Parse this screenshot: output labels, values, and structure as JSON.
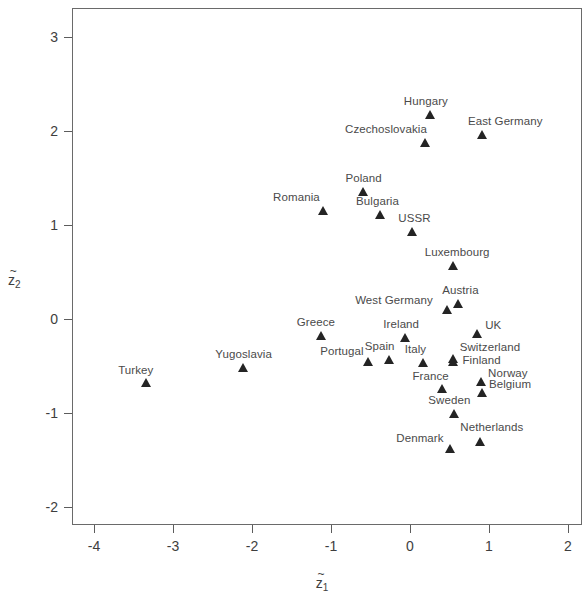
{
  "chart_data": {
    "type": "scatter",
    "title": "",
    "xlabel": "z̃₁",
    "ylabel": "z̃₂",
    "xlim": [
      -4.6,
      2.1
    ],
    "ylim": [
      -2.2,
      3.3
    ],
    "xticks": [
      -4,
      -3,
      -2,
      -1,
      0,
      1,
      2
    ],
    "xticklabels": [
      "-4",
      "-3",
      "-2",
      "-1",
      "0",
      "1",
      "2"
    ],
    "yticks": [
      -2,
      -1,
      0,
      1,
      2,
      3
    ],
    "yticklabels": [
      "-2",
      "-1",
      "0",
      "1",
      "2",
      "3"
    ],
    "grid": false,
    "legend": null,
    "marker": "triangle-up",
    "marker_color": "#242424",
    "points": [
      {
        "label": "Hungary",
        "x": 0.25,
        "y": 2.13,
        "lx": -26,
        "ly": -14
      },
      {
        "label": "East Germany",
        "x": 0.91,
        "y": 1.92,
        "lx": -14,
        "ly": -14
      },
      {
        "label": "Czechoslovakia",
        "x": 0.19,
        "y": 1.83,
        "lx": -80,
        "ly": -14
      },
      {
        "label": "Poland",
        "x": -0.59,
        "y": 1.31,
        "lx": -18,
        "ly": -14
      },
      {
        "label": "Romania",
        "x": -1.1,
        "y": 1.11,
        "lx": -50,
        "ly": -14
      },
      {
        "label": "Bulgaria",
        "x": -0.38,
        "y": 1.06,
        "lx": -24,
        "ly": -14
      },
      {
        "label": "USSR",
        "x": 0.03,
        "y": 0.88,
        "lx": -14,
        "ly": -14
      },
      {
        "label": "Luxembourg",
        "x": 0.54,
        "y": 0.52,
        "lx": -28,
        "ly": -14
      },
      {
        "label": "Austria",
        "x": 0.61,
        "y": 0.12,
        "lx": -16,
        "ly": -14
      },
      {
        "label": "West Germany",
        "x": 0.47,
        "y": 0.05,
        "lx": -92,
        "ly": -10
      },
      {
        "label": "Greece",
        "x": -1.13,
        "y": -0.22,
        "lx": -24,
        "ly": -14
      },
      {
        "label": "UK",
        "x": 0.85,
        "y": -0.2,
        "lx": 8,
        "ly": -9
      },
      {
        "label": "Ireland",
        "x": -0.06,
        "y": -0.24,
        "lx": -22,
        "ly": -14
      },
      {
        "label": "Switzerland",
        "x": 0.54,
        "y": -0.47,
        "lx": 7,
        "ly": -12
      },
      {
        "label": "Spain",
        "x": -0.27,
        "y": -0.48,
        "lx": -24,
        "ly": -14
      },
      {
        "label": "Italy",
        "x": 0.16,
        "y": -0.51,
        "lx": -18,
        "ly": -14
      },
      {
        "label": "Portugal",
        "x": -0.53,
        "y": -0.5,
        "lx": -48,
        "ly": -11
      },
      {
        "label": "Yugoslavia",
        "x": -2.11,
        "y": -0.56,
        "lx": -28,
        "ly": -14
      },
      {
        "label": "Finland",
        "x": 0.55,
        "y": -0.5,
        "lx": 9,
        "ly": -2
      },
      {
        "label": "France",
        "x": 0.41,
        "y": -0.79,
        "lx": -30,
        "ly": -13
      },
      {
        "label": "Norway",
        "x": 0.9,
        "y": -0.71,
        "lx": 7,
        "ly": -9
      },
      {
        "label": "Belgium",
        "x": 0.91,
        "y": -0.83,
        "lx": 7,
        "ly": -9
      },
      {
        "label": "Turkey",
        "x": -3.34,
        "y": -0.72,
        "lx": -28,
        "ly": -13
      },
      {
        "label": "Sweden",
        "x": 0.56,
        "y": -1.05,
        "lx": -26,
        "ly": -14
      },
      {
        "label": "Netherlands",
        "x": 0.89,
        "y": -1.35,
        "lx": -20,
        "ly": -15
      },
      {
        "label": "Denmark",
        "x": 0.51,
        "y": -1.43,
        "lx": -54,
        "ly": -11
      }
    ]
  },
  "axes": {
    "x_title_base": "z",
    "x_title_sub": "1",
    "y_title_base": "z",
    "y_title_sub": "2",
    "tilde": "~"
  }
}
